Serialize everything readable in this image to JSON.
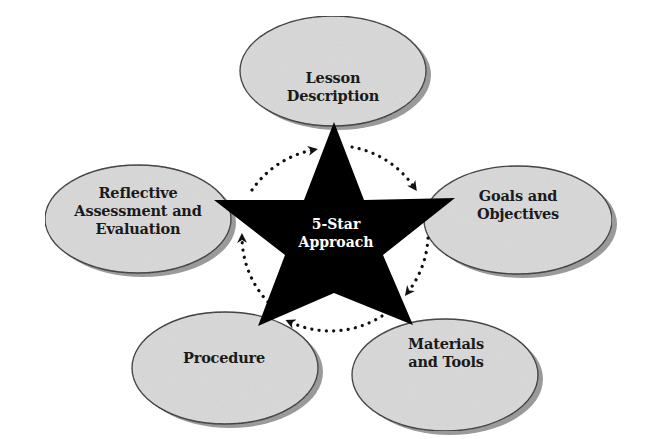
{
  "diagram": {
    "title": "5-Star Approach",
    "center": {
      "lines": [
        "5-Star",
        "Approach"
      ],
      "fill": "#000000",
      "text_color": "#ffffff"
    },
    "nodes": [
      {
        "id": "lesson-description",
        "lines": [
          "Lesson",
          "Description"
        ]
      },
      {
        "id": "goals-and-objectives",
        "lines": [
          "Goals and",
          "Objectives"
        ]
      },
      {
        "id": "materials-and-tools",
        "lines": [
          "Materials",
          "and Tools"
        ]
      },
      {
        "id": "procedure",
        "lines": [
          "Procedure"
        ]
      },
      {
        "id": "reflective-assessment",
        "lines": [
          "Reflective",
          "Assessment and",
          "Evaluation"
        ]
      }
    ],
    "cycle_direction": "clockwise",
    "colors": {
      "ellipse_fill": "#d9d9d9",
      "ellipse_stroke": "#2a2a2a",
      "shadow": "#9a9a9a",
      "star": "#000000",
      "dots": "#111111"
    }
  }
}
